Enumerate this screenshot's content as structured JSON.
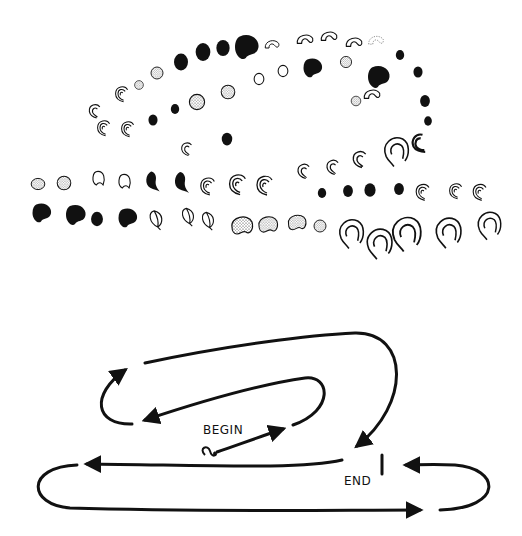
{
  "figure": {
    "ink_color": "#111111",
    "background": "#ffffff",
    "top_panel": {
      "description": "Sequence of embryo-shaped glyphs arranged along a folded path",
      "glyph_types": [
        "filled",
        "stippled",
        "outline",
        "curl",
        "double-curl",
        "filled-comma",
        "teardrop",
        "large-curl",
        "bean-filled",
        "bean-stippled",
        "crescent"
      ]
    },
    "bottom_panel": {
      "begin_label": "BEGIN",
      "end_label": "END",
      "start_marker_icon": "curl-start-icon",
      "end_marker_icon": "end-bar-icon"
    }
  }
}
